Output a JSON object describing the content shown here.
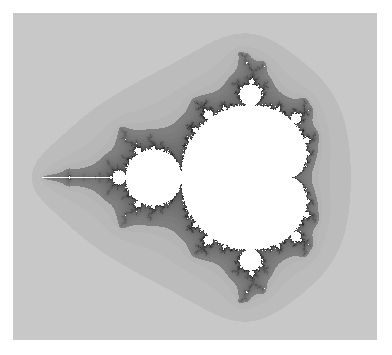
{
  "image": {
    "subject": "Mandelbrot set",
    "description": "Grayscale rendering of the Mandelbrot set; set interior white, exterior shaded gray by escape-time bands",
    "colors": {
      "interior": "#ffffff",
      "background": "#ffffff",
      "outer_band": "#d2d2d2",
      "inner_band": "#bdbdbd",
      "boundary": "#3a3a3a"
    },
    "view": {
      "re_min": -2.26,
      "im_center": 0.0,
      "pixels_per_unit": 111
    }
  }
}
